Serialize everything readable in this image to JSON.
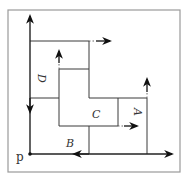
{
  "diagram": {
    "type": "rectangle-packing / skyline diagram",
    "origin_label": "p",
    "regions": [
      {
        "id": "A",
        "label": "A",
        "rotated": true
      },
      {
        "id": "B",
        "label": "B",
        "rotated": false
      },
      {
        "id": "C",
        "label": "C",
        "rotated": false
      },
      {
        "id": "D",
        "label": "D",
        "rotated": true
      }
    ],
    "colors": {
      "line": "#3a3a3a",
      "axis": "#222222",
      "frame": "#9a9a9a",
      "background": "#ffffff"
    }
  }
}
